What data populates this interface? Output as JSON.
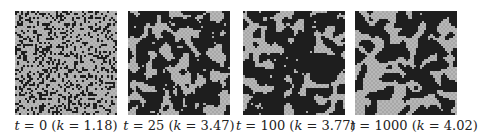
{
  "figure": {
    "panels": [
      {
        "t_label": "t",
        "t_value": "0",
        "k_label": "k",
        "k_value": "1.18",
        "cluster": 0.0,
        "density": 0.32,
        "seed": 11
      },
      {
        "t_label": "t",
        "t_value": "25",
        "k_label": "k",
        "k_value": "3.47",
        "cluster": 0.55,
        "density": 0.34,
        "seed": 23
      },
      {
        "t_label": "t",
        "t_value": "100",
        "k_label": "k",
        "k_value": "3.77",
        "cluster": 0.7,
        "density": 0.33,
        "seed": 37
      },
      {
        "t_label": "t",
        "t_value": "1000",
        "k_label": "k",
        "k_value": "4.02",
        "cluster": 0.8,
        "density": 0.33,
        "seed": 51
      }
    ],
    "colors": {
      "dark": "#1e1e1e",
      "light": "#a8a8a8",
      "grid": "#b8b8b8"
    },
    "grid_size": 50
  }
}
